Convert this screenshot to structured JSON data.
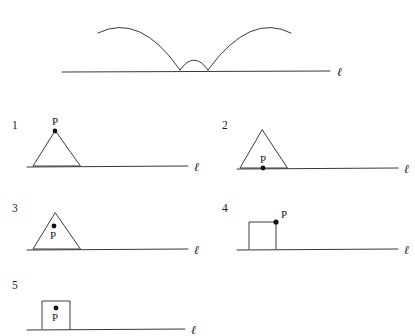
{
  "page": {
    "background_color": "#ffffff",
    "stroke_color": "#3a3a3a",
    "dot_color": "#111111"
  },
  "top_figure": {
    "name": "bouncing-arc-path",
    "line_label": "ℓ",
    "line": {
      "x1": 62,
      "y1": 72,
      "x2": 330,
      "y2": 71
    },
    "line_label_pos": {
      "x": 338,
      "y": 76
    },
    "arcs": [
      {
        "name": "large-arc-left",
        "d": "M 98 33 Q 140 12 180 70"
      },
      {
        "name": "small-arc-middle",
        "d": "M 180 70 Q 194 50 208 70"
      },
      {
        "name": "large-arc-right",
        "d": "M 208 70 Q 250 12 291 33"
      }
    ]
  },
  "options": [
    {
      "number": "1",
      "name": "option-triangle-apex-point",
      "shape": "triangle",
      "point_position": "apex",
      "point_label": "P",
      "line_label": "ℓ"
    },
    {
      "number": "2",
      "name": "option-triangle-base-point",
      "shape": "triangle",
      "point_position": "base-midpoint",
      "point_label": "P",
      "line_label": "ℓ"
    },
    {
      "number": "3",
      "name": "option-triangle-interior-point",
      "shape": "triangle",
      "point_position": "interior",
      "point_label": "P",
      "line_label": "ℓ"
    },
    {
      "number": "4",
      "name": "option-square-corner-point",
      "shape": "square",
      "point_position": "top-right-corner",
      "point_label": "P",
      "line_label": "ℓ"
    },
    {
      "number": "5",
      "name": "option-square-interior-point",
      "shape": "square",
      "point_position": "interior",
      "point_label": "P",
      "line_label": "ℓ"
    }
  ]
}
